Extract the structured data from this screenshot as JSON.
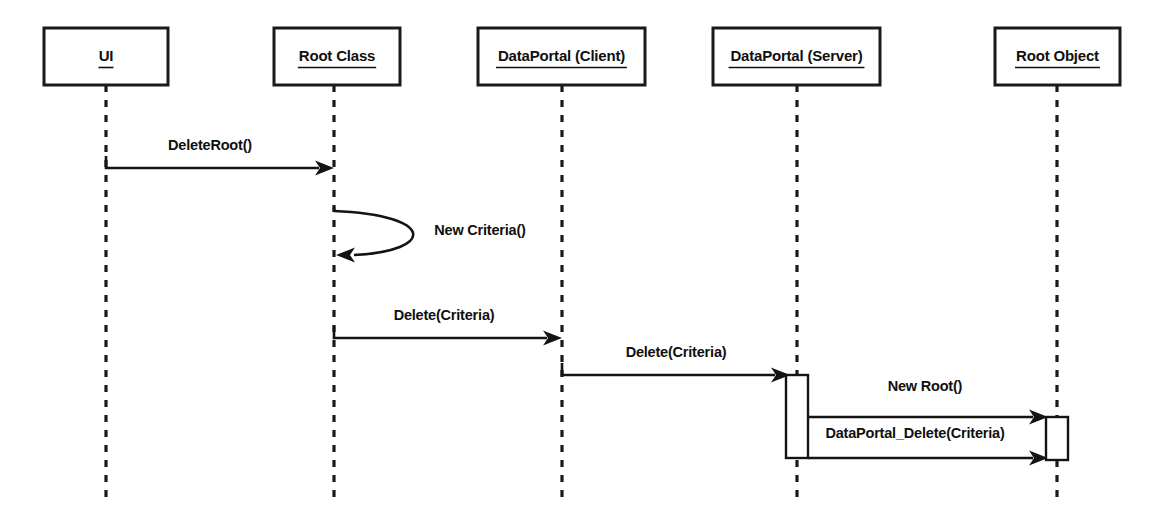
{
  "diagram": {
    "type": "uml-sequence-diagram",
    "canvas": {
      "width": 1158,
      "height": 515
    },
    "colors": {
      "background": "#ffffff",
      "stroke": "#141414",
      "text": "#101010",
      "box_fill": "#ffffff"
    },
    "participants": [
      {
        "id": "ui",
        "label": "UI",
        "box": {
          "x": 44,
          "y": 28,
          "width": 124,
          "height": 57
        },
        "lifeline_x": 106,
        "lifeline_top": 85,
        "lifeline_bottom": 497
      },
      {
        "id": "root-class",
        "label": "Root Class",
        "box": {
          "x": 274,
          "y": 28,
          "width": 126,
          "height": 57
        },
        "lifeline_x": 334,
        "lifeline_top": 85,
        "lifeline_bottom": 497
      },
      {
        "id": "dataportal-client",
        "label": "DataPortal (Client)",
        "box": {
          "x": 478,
          "y": 28,
          "width": 167,
          "height": 57
        },
        "lifeline_x": 562,
        "lifeline_top": 85,
        "lifeline_bottom": 497
      },
      {
        "id": "dataportal-server",
        "label": "DataPortal (Server)",
        "box": {
          "x": 713,
          "y": 28,
          "width": 167,
          "height": 57
        },
        "lifeline_x": 797,
        "lifeline_top": 85,
        "lifeline_bottom": 497
      },
      {
        "id": "root-object",
        "label": "Root Object",
        "box": {
          "x": 995,
          "y": 28,
          "width": 125,
          "height": 57
        },
        "lifeline_x": 1057,
        "lifeline_top": 85,
        "lifeline_bottom": 497
      }
    ],
    "messages": [
      {
        "id": "msg-deleteroot",
        "label": "DeleteRoot()",
        "kind": "call",
        "from": "ui",
        "to": "root-class",
        "x1": 106,
        "x2": 334,
        "y": 168,
        "stub_up": 12,
        "label_x": 210,
        "label_y": 146
      },
      {
        "id": "msg-new-criteria",
        "label": "New Criteria()",
        "kind": "self-call",
        "from": "root-class",
        "to": "root-class",
        "x_origin": 334,
        "y_start": 211,
        "y_end": 255,
        "bulge_x": 418,
        "label_x": 480,
        "label_y": 231
      },
      {
        "id": "msg-delete-criteria-client",
        "label": "Delete(Criteria)",
        "kind": "call",
        "from": "root-class",
        "to": "dataportal-client",
        "x1": 334,
        "x2": 562,
        "y": 338,
        "stub_up": 12,
        "label_x": 444,
        "label_y": 316
      },
      {
        "id": "msg-delete-criteria-server",
        "label": "Delete(Criteria)",
        "kind": "call",
        "from": "dataportal-client",
        "to": "dataportal-server",
        "x1": 562,
        "x2": 790,
        "y": 375,
        "stub_up": 12,
        "label_x": 676,
        "label_y": 353
      },
      {
        "id": "msg-new-root",
        "label": "New Root()",
        "kind": "call",
        "from": "dataportal-server",
        "to": "root-object",
        "x1": 808,
        "x2": 1048,
        "y": 417,
        "stub_up": 0,
        "label_x": 925,
        "label_y": 387
      },
      {
        "id": "msg-dataportal-delete",
        "label": "DataPortal_Delete(Criteria)",
        "kind": "call",
        "from": "dataportal-server",
        "to": "root-object",
        "x1": 808,
        "x2": 1048,
        "y": 458,
        "stub_up": 0,
        "label_x": 915,
        "label_y": 434
      }
    ],
    "activations": [
      {
        "id": "activation-dataportal-server",
        "participant": "dataportal-server",
        "x": 786,
        "y": 375,
        "width": 22,
        "height": 83
      },
      {
        "id": "activation-root-object",
        "participant": "root-object",
        "x": 1046,
        "y": 417,
        "width": 22,
        "height": 43
      }
    ]
  }
}
